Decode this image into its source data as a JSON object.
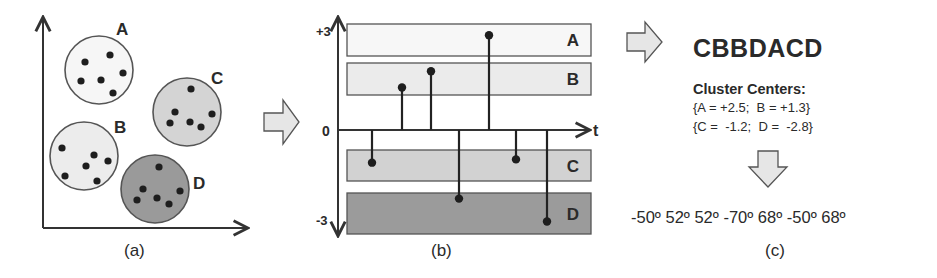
{
  "figure": {
    "panels": {
      "a": {
        "caption": "(a)",
        "clusters": [
          {
            "label": "A",
            "fill": "#f6f6f6",
            "cx": 99,
            "cy": 70,
            "r": 34,
            "lx": 116,
            "ly": 35,
            "points": [
              [
                85,
                62
              ],
              [
                110,
                55
              ],
              [
                123,
                73
              ],
              [
                81,
                81
              ],
              [
                101,
                80
              ],
              [
                113,
                93
              ]
            ]
          },
          {
            "label": "C",
            "fill": "#d4d4d4",
            "cx": 187,
            "cy": 112,
            "r": 34,
            "lx": 211,
            "ly": 84,
            "points": [
              [
                191,
                89
              ],
              [
                175,
                112
              ],
              [
                170,
                123
              ],
              [
                190,
                122
              ],
              [
                201,
                127
              ],
              [
                212,
                114
              ]
            ]
          },
          {
            "label": "B",
            "fill": "#ececec",
            "cx": 84,
            "cy": 156,
            "r": 34,
            "lx": 114,
            "ly": 133,
            "points": [
              [
                62,
                148
              ],
              [
                94,
                155
              ],
              [
                108,
                161
              ],
              [
                86,
                166
              ],
              [
                65,
                176
              ],
              [
                97,
                181
              ]
            ]
          },
          {
            "label": "D",
            "fill": "#9a9a9a",
            "cx": 155,
            "cy": 189,
            "r": 34,
            "lx": 193,
            "ly": 189,
            "points": [
              [
                159,
                167
              ],
              [
                143,
                189
              ],
              [
                137,
                200
              ],
              [
                157,
                198
              ],
              [
                169,
                204
              ],
              [
                180,
                191
              ]
            ]
          }
        ]
      },
      "b": {
        "caption": "(b)",
        "y_ticks": {
          "top": "+3",
          "zero": "0",
          "bottom": "-3"
        },
        "x_axis_label": "t",
        "bands": [
          {
            "label": "A",
            "fill": "#f7f7f7",
            "y": 24,
            "h": 32
          },
          {
            "label": "B",
            "fill": "#ebebeb",
            "y": 63,
            "h": 32
          },
          {
            "label": "C",
            "fill": "#d2d2d2",
            "y": 150,
            "h": 31
          },
          {
            "label": "D",
            "fill": "#9b9b9b",
            "y": 193,
            "h": 41
          }
        ]
      },
      "c": {
        "caption": "(c)",
        "symbol_sequence": "CBBDACD",
        "cluster_centers_title": "Cluster Centers:",
        "cluster_centers_line1": "{A = +2.5;  B = +1.3}",
        "cluster_centers_line2": "{C =  -1.2;  D =  -2.8}",
        "angles_line": "-50º 52º 52º -70º 68º -50º 68º"
      }
    },
    "arrows": [
      {
        "name": "arrow-a-to-b",
        "direction": "right"
      },
      {
        "name": "arrow-b-to-c",
        "direction": "right"
      },
      {
        "name": "arrow-centers-to-angles",
        "direction": "down"
      }
    ]
  },
  "chart_data": {
    "type": "stem",
    "title": "",
    "xlabel": "t",
    "ylabel": "",
    "ylim": [
      -3,
      3
    ],
    "y_tick_labels": [
      "+3",
      "0",
      "-3"
    ],
    "x": [
      1,
      2,
      3,
      4,
      5,
      6,
      7
    ],
    "values": [
      -1.0,
      1.3,
      1.8,
      -2.1,
      2.9,
      -0.9,
      -2.8
    ],
    "symbols": [
      "C",
      "B",
      "B",
      "D",
      "A",
      "C",
      "D"
    ],
    "bands": [
      {
        "label": "A",
        "range": [
          2.1,
          3.0
        ]
      },
      {
        "label": "B",
        "range": [
          1.0,
          1.9
        ]
      },
      {
        "label": "C",
        "range": [
          -0.5,
          -1.4
        ]
      },
      {
        "label": "D",
        "range": [
          -1.8,
          -3.0
        ]
      }
    ],
    "cluster_centers": {
      "A": 2.5,
      "B": 1.3,
      "C": -1.2,
      "D": -2.8
    },
    "symbol_sequence": "CBBDACD",
    "angles_deg": [
      -50,
      52,
      52,
      -70,
      68,
      -50,
      68
    ],
    "grid": false,
    "legend": "none"
  }
}
